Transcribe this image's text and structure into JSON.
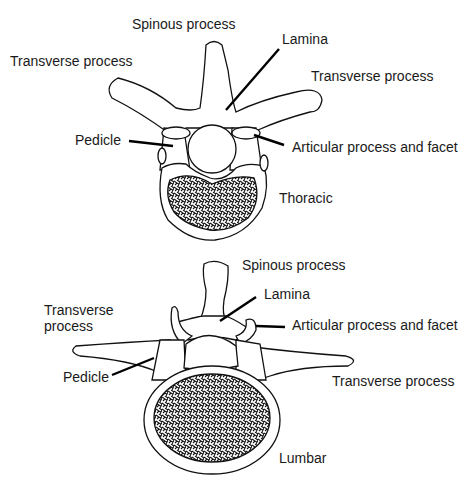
{
  "thoracic": {
    "title": "Thoracic",
    "labels": {
      "spinous": "Spinous process",
      "lamina": "Lamina",
      "transverse_left": "Transverse process",
      "transverse_right": "Transverse process",
      "pedicle": "Pedicle",
      "articular": "Articular process and facet"
    }
  },
  "lumbar": {
    "title": "Lumbar",
    "labels": {
      "spinous": "Spinous process",
      "lamina": "Lamina",
      "transverse_left_line1": "Transverse",
      "transverse_left_line2": "process",
      "articular": "Articular process and facet",
      "pedicle": "Pedicle",
      "transverse_right": "Transverse process"
    }
  }
}
